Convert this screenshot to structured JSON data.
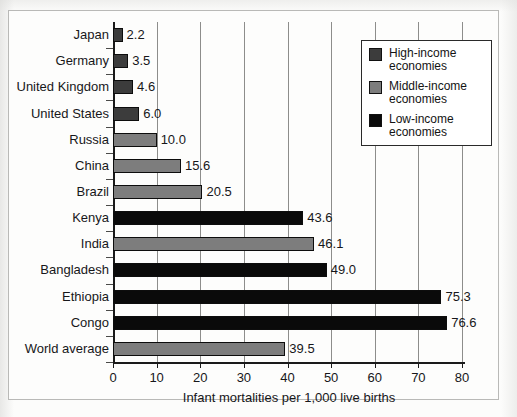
{
  "chart_data": {
    "type": "bar",
    "orientation": "horizontal",
    "title": "",
    "xlabel": "Infant mortalities per 1,000 live births",
    "ylabel": "",
    "xlim": [
      0,
      80
    ],
    "xticks": [
      0,
      10,
      20,
      30,
      40,
      50,
      60,
      70,
      80
    ],
    "xtick_labels": [
      "0",
      "10",
      "20",
      "30",
      "40",
      "50",
      "60",
      "70",
      "80"
    ],
    "grid": "vertical",
    "categories": [
      "Japan",
      "Germany",
      "United Kingdom",
      "United States",
      "Russia",
      "China",
      "Brazil",
      "Kenya",
      "India",
      "Bangladesh",
      "Ethiopia",
      "Congo",
      "World average"
    ],
    "values": [
      2.2,
      3.5,
      4.6,
      6.0,
      10.0,
      15.6,
      20.5,
      43.6,
      46.1,
      49.0,
      75.3,
      76.6,
      39.5
    ],
    "value_labels": [
      "2.2",
      "3.5",
      "4.6",
      "6.0",
      "10.0",
      "15.6",
      "20.5",
      "43.6",
      "46.1",
      "49.0",
      "75.3",
      "76.6",
      "39.5"
    ],
    "groups": [
      "high",
      "high",
      "high",
      "high",
      "middle",
      "middle",
      "middle",
      "low",
      "middle",
      "low",
      "low",
      "low",
      "middle"
    ],
    "colors": {
      "high": "#3c3c3c",
      "middle": "#7d7d7d",
      "low": "#0a0a0a"
    },
    "legend": {
      "position": "upper-right",
      "entries": [
        {
          "key": "high",
          "label": "High-income\neconomies"
        },
        {
          "key": "middle",
          "label": "Middle-income\neconomies"
        },
        {
          "key": "low",
          "label": "Low-income\neconomies"
        }
      ]
    }
  }
}
